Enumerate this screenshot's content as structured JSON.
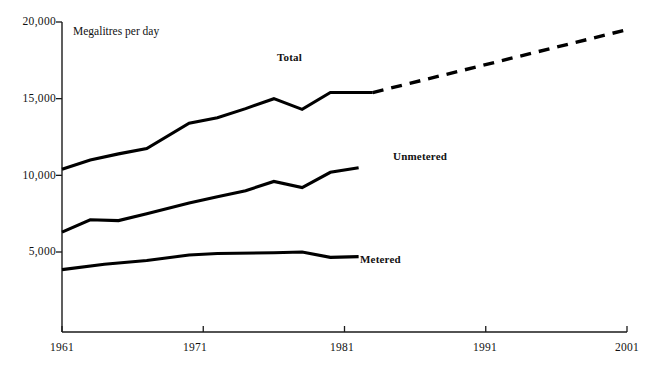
{
  "chart_data": {
    "type": "line",
    "title": "",
    "subtitle": "",
    "xlabel": "",
    "ylabel": "Megalitres per day",
    "ylim": [
      0,
      20000
    ],
    "xlim": [
      1961,
      2001
    ],
    "grid": false,
    "legend_position": "inline-labels",
    "y_ticks": [
      "5,000",
      "10,000",
      "15,000",
      "20,000"
    ],
    "y_tick_values": [
      5000,
      10000,
      15000,
      20000
    ],
    "x_ticks": [
      "1961",
      "1971",
      "1981",
      "1991",
      "2001"
    ],
    "x_tick_values": [
      1961,
      1971,
      1981,
      1991,
      2001
    ],
    "annotation": "Megalitres per day",
    "series": [
      {
        "name": "Total",
        "label": "Total",
        "style": "solid",
        "x": [
          1961,
          1963,
          1965,
          1967,
          1970,
          1972,
          1974,
          1976,
          1978,
          1980,
          1982,
          1983
        ],
        "values": [
          10400,
          11000,
          11400,
          11750,
          13400,
          13750,
          14350,
          15000,
          14300,
          15400,
          15400,
          15400
        ]
      },
      {
        "name": "Total (projected)",
        "label": "",
        "style": "dashed",
        "x": [
          1983,
          2001
        ],
        "values": [
          15400,
          19500
        ]
      },
      {
        "name": "Unmetered",
        "label": "Unmetered",
        "style": "solid",
        "x": [
          1961,
          1963,
          1965,
          1967,
          1970,
          1972,
          1974,
          1976,
          1978,
          1980,
          1982
        ],
        "values": [
          6300,
          7100,
          7050,
          7500,
          8200,
          8600,
          9000,
          9600,
          9200,
          10200,
          10500
        ]
      },
      {
        "name": "Metered",
        "label": "Metered",
        "style": "solid",
        "x": [
          1961,
          1964,
          1967,
          1970,
          1972,
          1976,
          1978,
          1980,
          1982
        ],
        "values": [
          3850,
          4200,
          4450,
          4800,
          4900,
          4950,
          5000,
          4650,
          4700
        ]
      }
    ]
  },
  "axes": {
    "y_axis_caption": "Megalitres per day",
    "y_labels": [
      {
        "text": "20,000",
        "value": 20000
      },
      {
        "text": "15,000",
        "value": 15000
      },
      {
        "text": "10,000",
        "value": 10000
      },
      {
        "text": "5,000",
        "value": 5000
      }
    ],
    "x_labels": [
      {
        "text": "1961",
        "value": 1961
      },
      {
        "text": "1971",
        "value": 1971
      },
      {
        "text": "1981",
        "value": 1981
      },
      {
        "text": "1991",
        "value": 1991
      },
      {
        "text": "2001",
        "value": 2001
      }
    ]
  },
  "series_labels": {
    "total": "Total",
    "unmetered": "Unmetered",
    "metered": "Metered"
  },
  "colors": {
    "line": "#000000",
    "axis": "#1a1a1a",
    "background": "#ffffff",
    "text": "#111111"
  }
}
